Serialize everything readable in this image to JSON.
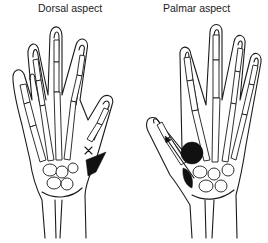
{
  "figure": {
    "panels": [
      {
        "id": "dorsal",
        "label": "Dorsal aspect"
      },
      {
        "id": "palmar",
        "label": "Palmar aspect"
      }
    ],
    "markers": {
      "dorsal": [
        "x-mark",
        "shaded-triangle-region"
      ],
      "palmar": [
        "shaded-circle-region",
        "shaded-region",
        "arrow"
      ]
    },
    "colors": {
      "ink": "#1a1a1a",
      "background": "#ffffff"
    }
  }
}
